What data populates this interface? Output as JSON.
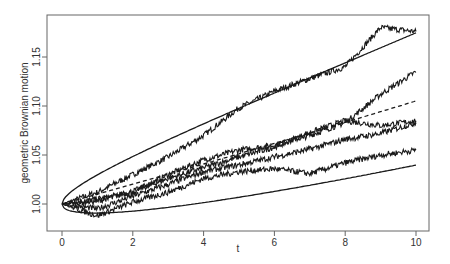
{
  "chart_data": {
    "type": "line",
    "title": "",
    "xlabel": "t",
    "ylabel": "geometric Brownian motion",
    "xlim": [
      -0.35,
      10.4
    ],
    "ylim": [
      0.972,
      1.193
    ],
    "x_ticks": [
      0,
      2,
      4,
      6,
      8,
      10
    ],
    "x_tick_labels": [
      "0",
      "2",
      "4",
      "6",
      "8",
      "10"
    ],
    "y_ticks": [
      1.0,
      1.05,
      1.1,
      1.15
    ],
    "y_tick_labels": [
      "1.00",
      "1.05",
      "1.10",
      "1.15"
    ],
    "grid": false,
    "legend": null,
    "x": [
      0,
      1,
      2,
      3,
      4,
      5,
      6,
      7,
      8,
      9,
      10
    ],
    "series": [
      {
        "name": "upper envelope",
        "style": "solid",
        "values": [
          1.0,
          1.031,
          1.051,
          1.069,
          1.085,
          1.101,
          1.116,
          1.131,
          1.146,
          1.161,
          1.175
        ]
      },
      {
        "name": "mean",
        "style": "dashed",
        "values": [
          1.0,
          1.01,
          1.02,
          1.03,
          1.041,
          1.051,
          1.062,
          1.073,
          1.083,
          1.094,
          1.105
        ]
      },
      {
        "name": "lower envelope",
        "style": "solid",
        "values": [
          1.0,
          0.991,
          0.993,
          0.996,
          1.0,
          1.004,
          1.009,
          1.015,
          1.021,
          1.028,
          1.037
        ]
      },
      {
        "name": "path 1",
        "style": "solid",
        "values": [
          1.0,
          1.012,
          1.03,
          1.048,
          1.07,
          1.098,
          1.115,
          1.128,
          1.14,
          1.18,
          1.176
        ]
      },
      {
        "name": "path 2",
        "style": "solid",
        "values": [
          1.0,
          1.005,
          1.012,
          1.03,
          1.045,
          1.055,
          1.06,
          1.07,
          1.083,
          1.112,
          1.135
        ]
      },
      {
        "name": "path 3",
        "style": "solid",
        "values": [
          1.0,
          1.003,
          1.013,
          1.026,
          1.037,
          1.048,
          1.058,
          1.073,
          1.085,
          1.08,
          1.085
        ]
      },
      {
        "name": "path 4",
        "style": "solid",
        "values": [
          1.0,
          0.995,
          1.008,
          1.02,
          1.033,
          1.04,
          1.048,
          1.056,
          1.066,
          1.072,
          1.083
        ]
      },
      {
        "name": "path 5",
        "style": "solid",
        "values": [
          1.0,
          0.988,
          1.002,
          1.012,
          1.026,
          1.033,
          1.036,
          1.031,
          1.042,
          1.05,
          1.055
        ]
      }
    ]
  },
  "colors": {
    "line": "#1a1a1a",
    "frame": "#555555",
    "text": "#333333",
    "background": "#ffffff"
  }
}
